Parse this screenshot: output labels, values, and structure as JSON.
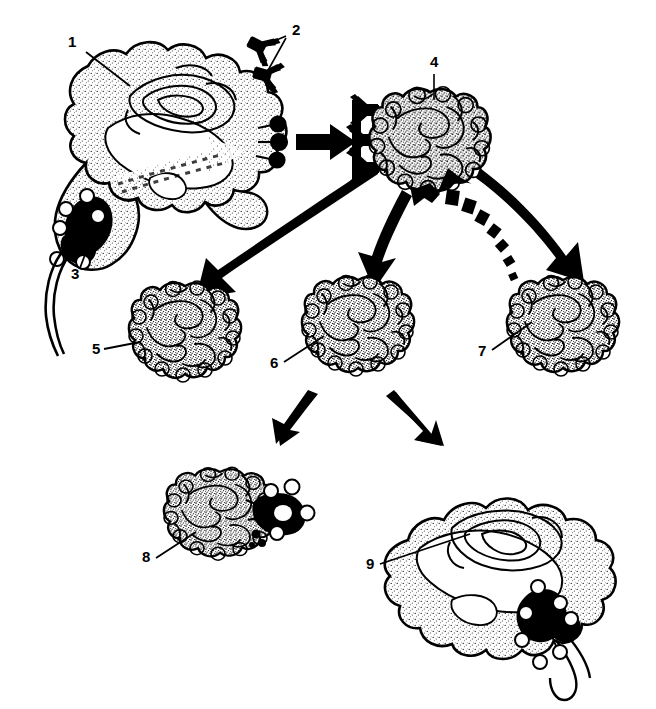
{
  "figure": {
    "type": "scientific-diagram",
    "width": 656,
    "height": 709,
    "background_color": "#ffffff",
    "ink_color": "#000000",
    "style": "black-and-white stippled line drawing"
  },
  "labels": [
    {
      "id": "label-1",
      "text": "1",
      "x": 68,
      "y": 42,
      "refers_to": "large stippled cell with lobed nucleus and flagellum, upper left"
    },
    {
      "id": "label-2",
      "text": "2",
      "x": 292,
      "y": 30,
      "refers_to": "pair of dark Y-shaped surface receptors / antibodies"
    },
    {
      "id": "label-3",
      "text": "3",
      "x": 71,
      "y": 274,
      "refers_to": "dark inner body with small open circles, lower part of cell 1"
    },
    {
      "id": "label-4",
      "text": "4",
      "x": 430,
      "y": 62,
      "refers_to": "round stippled cell bearing three Y-shaped receptors"
    },
    {
      "id": "label-5",
      "text": "5",
      "x": 92,
      "y": 344,
      "refers_to": "round stippled daughter cell, left of middle row"
    },
    {
      "id": "label-6",
      "text": "6",
      "x": 270,
      "y": 358,
      "refers_to": "round stippled daughter cell, centre of middle row"
    },
    {
      "id": "label-7",
      "text": "7",
      "x": 478,
      "y": 346,
      "refers_to": "round stippled daughter cell, right of middle row"
    },
    {
      "id": "label-8",
      "text": "8",
      "x": 142,
      "y": 552,
      "refers_to": "round stippled cell with dark granular appendage, lower left"
    },
    {
      "id": "label-9",
      "text": "9",
      "x": 366,
      "y": 559,
      "refers_to": "large stippled cell with lobed nucleus, lower right"
    }
  ],
  "cells": [
    {
      "name": "cell-1",
      "label": "1",
      "cx": 168,
      "cy": 150,
      "rx": 120,
      "ry": 90,
      "style": "large-lobed-stippled",
      "has_flagellum": true,
      "has_dark_body": true
    },
    {
      "name": "cell-4",
      "label": "4",
      "cx": 428,
      "cy": 145,
      "rx": 55,
      "ry": 52,
      "style": "round-convoluted-stippled",
      "receptors": 3
    },
    {
      "name": "cell-5",
      "label": "5",
      "cx": 185,
      "cy": 333,
      "rx": 50,
      "ry": 48,
      "style": "round-convoluted-stippled"
    },
    {
      "name": "cell-6",
      "label": "6",
      "cx": 358,
      "cy": 327,
      "rx": 50,
      "ry": 48,
      "style": "round-convoluted-stippled"
    },
    {
      "name": "cell-7",
      "label": "7",
      "cx": 563,
      "cy": 327,
      "rx": 50,
      "ry": 48,
      "style": "round-convoluted-stippled"
    },
    {
      "name": "cell-8",
      "label": "8",
      "cx": 222,
      "cy": 515,
      "rx": 52,
      "ry": 42,
      "style": "round-convoluted-stippled",
      "has_dark_granules": true
    },
    {
      "name": "cell-9",
      "label": "9",
      "cx": 500,
      "cy": 570,
      "rx": 110,
      "ry": 80,
      "style": "large-lobed-stippled",
      "has_flagellum": true,
      "has_dark_body": true
    }
  ],
  "receptors": [
    {
      "name": "receptor-pair-on-cell-1",
      "count": 2,
      "shape": "Y-shaped",
      "label": "2"
    },
    {
      "name": "receptor-triplet-on-cell-4",
      "count": 3,
      "shape": "Y-shaped"
    }
  ],
  "granule_dots": {
    "name": "surface-granule-dots",
    "count": 3,
    "shape": "filled-circle-on-stalk"
  },
  "arrows": [
    {
      "name": "arrow-cell1-to-cell4",
      "kind": "solid-straight",
      "from": "cell-1",
      "to": "cell-4",
      "direction": "right"
    },
    {
      "name": "arrow-cell4-to-cell5",
      "kind": "solid-curved-thick",
      "from": "cell-4",
      "to": "cell-5",
      "direction": "down-left"
    },
    {
      "name": "arrow-cell4-to-cell6",
      "kind": "solid-curved",
      "from": "cell-4",
      "to": "cell-6",
      "direction": "down"
    },
    {
      "name": "arrow-cell4-to-cell7",
      "kind": "solid-curved-thick",
      "from": "cell-4",
      "to": "cell-7",
      "direction": "down-right"
    },
    {
      "name": "arrow-cell7-to-cell4-dashed",
      "kind": "dashed-curved",
      "from": "cell-7",
      "to": "cell-4",
      "direction": "up-left",
      "meaning": "reverse / feedback pathway"
    },
    {
      "name": "arrow-cell6-to-cell8",
      "kind": "solid-short",
      "from": "cell-6",
      "to": "cell-8",
      "direction": "down-left"
    },
    {
      "name": "arrow-cell6-to-cell9",
      "kind": "solid-short",
      "from": "cell-6",
      "to": "cell-9",
      "direction": "down-right"
    }
  ]
}
